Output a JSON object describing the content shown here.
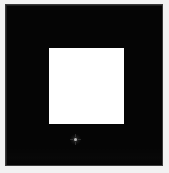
{
  "canvas": {
    "width": 169,
    "height": 173,
    "background_color": "#f2f2f2",
    "description": "High-contrast black field containing a centered white square"
  },
  "panel": {
    "name": "black-field",
    "fill_color": "#050505",
    "border_color": "#3a3a3a",
    "x": 5,
    "y": 4,
    "width": 158,
    "height": 162,
    "label": ""
  },
  "shapes": [
    {
      "id": "white-square",
      "type": "rectangle",
      "fill_color": "#ffffff",
      "x": 49,
      "y": 48,
      "width": 75,
      "height": 76,
      "label": ""
    },
    {
      "id": "faint-speck",
      "type": "point-marker",
      "fill_color": "#ebebeb",
      "x": 70,
      "y": 134,
      "width": 11,
      "height": 11,
      "label": ""
    }
  ],
  "annotations": {
    "visible_text": [],
    "note": ""
  }
}
